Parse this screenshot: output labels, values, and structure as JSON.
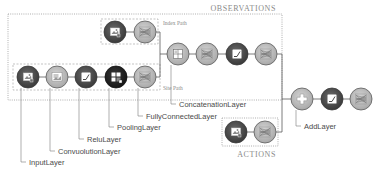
{
  "groups": {
    "observations": "OBSERVATIONS",
    "actions": "ACTIONS",
    "index_path": "Index Path",
    "site_path": "Site Path"
  },
  "labels": {
    "input": "InputLayer",
    "conv": "ConvuolutionLayer",
    "relu": "ReluLayer",
    "pool": "PoolingLayer",
    "fc": "FullyConnectedLayer",
    "concat": "ConcatenationLayer",
    "add": "AddLayer"
  },
  "nodes": [
    {
      "id": "idx-input",
      "type": "input",
      "x": 115,
      "y": 32
    },
    {
      "id": "idx-fc",
      "type": "fc",
      "x": 145,
      "y": 32
    },
    {
      "id": "site-input",
      "type": "input",
      "x": 28,
      "y": 77
    },
    {
      "id": "site-conv",
      "type": "conv",
      "x": 57,
      "y": 77
    },
    {
      "id": "site-relu",
      "type": "relu",
      "x": 86,
      "y": 77
    },
    {
      "id": "site-pool",
      "type": "pool",
      "x": 116,
      "y": 77
    },
    {
      "id": "site-fc",
      "type": "fc",
      "x": 145,
      "y": 77
    },
    {
      "id": "obs-concat",
      "type": "concat",
      "x": 178,
      "y": 54
    },
    {
      "id": "obs-fc1",
      "type": "fc",
      "x": 207,
      "y": 54
    },
    {
      "id": "obs-relu",
      "type": "relu",
      "x": 237,
      "y": 54
    },
    {
      "id": "obs-fc2",
      "type": "fc",
      "x": 266,
      "y": 54
    },
    {
      "id": "add",
      "type": "add",
      "x": 302,
      "y": 99
    },
    {
      "id": "out-relu",
      "type": "relu",
      "x": 332,
      "y": 99
    },
    {
      "id": "out-fc",
      "type": "fc",
      "x": 361,
      "y": 99
    },
    {
      "id": "act-input",
      "type": "input",
      "x": 236,
      "y": 132
    },
    {
      "id": "act-fc",
      "type": "fc",
      "x": 265,
      "y": 132
    }
  ],
  "colors": {
    "dark": "#4a4a4a",
    "black": "#2b2b2b",
    "light": "#b9b9b9",
    "stroke": "#5a5a5a",
    "dotted": "#9a9a9a"
  }
}
